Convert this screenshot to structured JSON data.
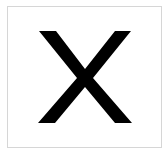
{
  "symbol": {
    "name": "X",
    "color": "#000000",
    "border_color": "#d6d6d6",
    "background": "#ffffff"
  }
}
